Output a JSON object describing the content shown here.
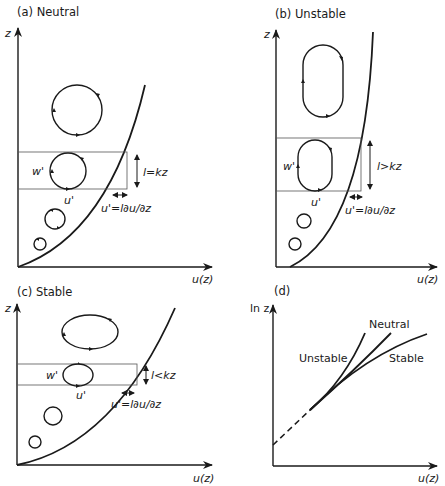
{
  "figure": {
    "panels": [
      {
        "id": "a",
        "title": "(a) Neutral",
        "y_axis_label": "z",
        "x_axis_label": "u(z)",
        "eddy_labels": {
          "vertical": "w'",
          "horizontal": "u'"
        },
        "mixing_length_label": "l=kz",
        "velocity_fluctuation_label": "u'=l∂u/∂z"
      },
      {
        "id": "b",
        "title": "(b) Unstable",
        "y_axis_label": "z",
        "x_axis_label": "u(z)",
        "eddy_labels": {
          "vertical": "w'",
          "horizontal": "u'"
        },
        "mixing_length_label": "l>kz",
        "velocity_fluctuation_label": "u'=l∂u/∂z"
      },
      {
        "id": "c",
        "title": "(c) Stable",
        "y_axis_label": "z",
        "x_axis_label": "u(z)",
        "eddy_labels": {
          "vertical": "w'",
          "horizontal": "u'"
        },
        "mixing_length_label": "l<kz",
        "velocity_fluctuation_label": "u'=l∂u/∂z"
      },
      {
        "id": "d",
        "title": "(d)",
        "y_axis_label": "ln z",
        "x_axis_label": "u(z)",
        "curve_labels": [
          "Neutral",
          "Unstable",
          "Stable"
        ]
      }
    ]
  }
}
